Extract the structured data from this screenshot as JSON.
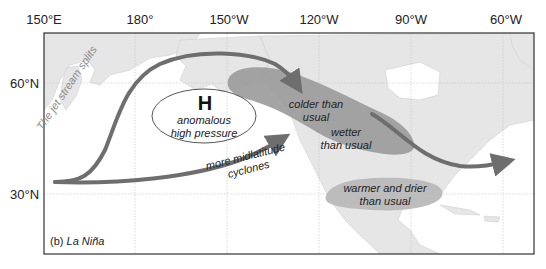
{
  "figure": {
    "panel_label": "(b)",
    "panel_title": "La Niña"
  },
  "axes": {
    "longitude_ticks": [
      {
        "label": "150°E",
        "x": 44
      },
      {
        "label": "180°",
        "x": 135
      },
      {
        "label": "150°W",
        "x": 227
      },
      {
        "label": "120°W",
        "x": 319
      },
      {
        "label": "90°W",
        "x": 411
      },
      {
        "label": "60°W",
        "x": 503
      }
    ],
    "latitude_ticks": [
      {
        "label": "60°N",
        "y": 83
      },
      {
        "label": "30°N",
        "y": 194
      }
    ]
  },
  "annotations": {
    "high_pressure_symbol": "H",
    "high_pressure_line1": "anomalous",
    "high_pressure_line2": "high pressure",
    "jet_split": "The jet stream splits",
    "cyclones_line1": "more midlatitude",
    "cyclones_line2": "cyclones",
    "colder_line1": "colder than",
    "colder_line2": "usual",
    "wetter_line1": "wetter",
    "wetter_line2": "than usual",
    "warmer_line1": "warmer and drier",
    "warmer_line2": "than usual"
  },
  "colors": {
    "land": "#e6e6e6",
    "ocean": "#ffffff",
    "jet_arrow": "#6e6e6e",
    "anomaly_dark": "#9a9a9a",
    "anomaly_light": "#b9b9b9",
    "frame": "#333333",
    "grid": "#c8c8c8"
  }
}
